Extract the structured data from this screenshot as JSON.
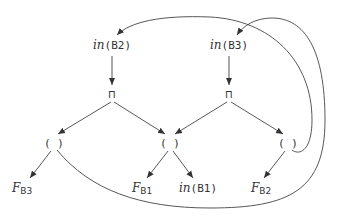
{
  "nodes": {
    "in_b2": {
      "fn": "in",
      "arg": "(B2)"
    },
    "in_b3": {
      "fn": "in",
      "arg": "(B3)"
    },
    "meet_left": {
      "label": "⊓"
    },
    "meet_right": {
      "label": "⊓"
    },
    "paren_left": {
      "label": "( )"
    },
    "paren_mid": {
      "label": "( )"
    },
    "paren_right": {
      "label": "( )"
    },
    "f_b3": {
      "fn": "F",
      "sub": "B3"
    },
    "f_b1": {
      "fn": "F",
      "sub": "B1"
    },
    "in_b1": {
      "fn": "in",
      "arg": "(B1)"
    },
    "f_b2": {
      "fn": "F",
      "sub": "B2"
    }
  },
  "edges": [
    {
      "from": "in_b2",
      "to": "meet_left"
    },
    {
      "from": "in_b3",
      "to": "meet_right"
    },
    {
      "from": "meet_left",
      "to": "paren_left"
    },
    {
      "from": "meet_left",
      "to": "paren_mid"
    },
    {
      "from": "meet_right",
      "to": "paren_mid"
    },
    {
      "from": "meet_right",
      "to": "paren_right"
    },
    {
      "from": "paren_left",
      "to": "f_b3"
    },
    {
      "from": "paren_mid",
      "to": "f_b1"
    },
    {
      "from": "paren_mid",
      "to": "in_b1"
    },
    {
      "from": "paren_right",
      "to": "f_b2"
    },
    {
      "from": "paren_right",
      "to": "in_b2",
      "curved": true
    },
    {
      "from": "paren_left",
      "to": "in_b3",
      "curved": true
    }
  ]
}
